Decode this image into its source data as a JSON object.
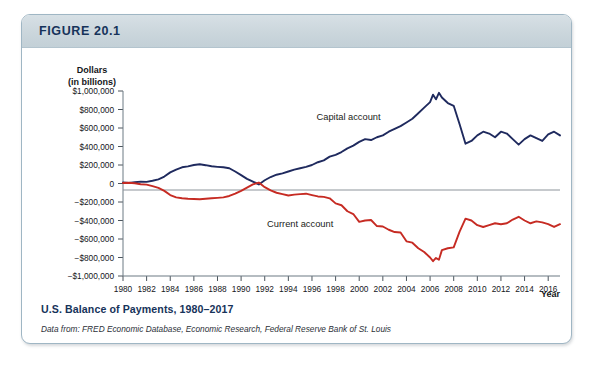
{
  "figure": {
    "number_label": "FIGURE 20.1",
    "caption_title": "U.S. Balance of Payments, 1980–2017",
    "caption_source": "Data from: FRED Economic Database, Economic Research, Federal Reserve Bank of St. Louis",
    "header_color": "#cbd6dc",
    "border_color": "#9fb6c4",
    "title_color": "#16335a"
  },
  "chart_data": {
    "type": "line",
    "title": "U.S. Balance of Payments, 1980–2017",
    "xlabel": "Year",
    "ylabel": "Dollars (in billions)",
    "ylabel_line1": "Dollars",
    "ylabel_line2": "(in billions)",
    "grid": false,
    "legend": "inline-annotations",
    "xlim": [
      1980,
      2017
    ],
    "ylim": [
      -1000000,
      1000000
    ],
    "ytick_labels": [
      "$1,000,000",
      "$800,000",
      "$600,000",
      "$400,000",
      "$200,000",
      "0",
      "−$200,000",
      "−$400,000",
      "−$600,000",
      "−$800,000",
      "−$1,000,000"
    ],
    "ytick_values": [
      1000000,
      800000,
      600000,
      400000,
      200000,
      0,
      -200000,
      -400000,
      -600000,
      -800000,
      -1000000
    ],
    "xtick_labels": [
      "1980",
      "1982",
      "1984",
      "1986",
      "1988",
      "1990",
      "1992",
      "1994",
      "1996",
      "1998",
      "2000",
      "2002",
      "2004",
      "2006",
      "2008",
      "2010",
      "2012",
      "2014",
      "2016"
    ],
    "xtick_values": [
      1980,
      1982,
      1984,
      1986,
      1988,
      1990,
      1992,
      1994,
      1996,
      1998,
      2000,
      2002,
      2004,
      2006,
      2008,
      2010,
      2012,
      2014,
      2016
    ],
    "series": [
      {
        "name": "Capital account",
        "label": "Capital account",
        "color": "#1f2a5e",
        "label_x": 1999.1,
        "label_y": 690000,
        "x": [
          1980,
          1980.5,
          1981,
          1981.5,
          1982,
          1982.5,
          1983,
          1983.5,
          1984,
          1984.5,
          1985,
          1985.5,
          1986,
          1986.5,
          1987,
          1987.5,
          1988,
          1988.5,
          1989,
          1989.5,
          1990,
          1990.5,
          1991,
          1991.5,
          1992,
          1992.5,
          1993,
          1993.5,
          1994,
          1994.5,
          1995,
          1995.5,
          1996,
          1996.5,
          1997,
          1997.5,
          1998,
          1998.5,
          1999,
          1999.5,
          2000,
          2000.5,
          2001,
          2001.5,
          2002,
          2002.5,
          2003,
          2003.5,
          2004,
          2004.5,
          2005,
          2005.5,
          2006,
          2006.25,
          2006.5,
          2006.75,
          2007,
          2007.5,
          2008,
          2008.5,
          2009,
          2009.5,
          2010,
          2010.5,
          2011,
          2011.5,
          2012,
          2012.5,
          2013,
          2013.5,
          2014,
          2014.5,
          2015,
          2015.5,
          2016,
          2016.5,
          2017
        ],
        "y": [
          10000,
          5000,
          14000,
          20000,
          18000,
          30000,
          45000,
          75000,
          120000,
          150000,
          175000,
          185000,
          200000,
          208000,
          198000,
          186000,
          180000,
          175000,
          165000,
          130000,
          90000,
          50000,
          20000,
          -10000,
          35000,
          70000,
          95000,
          110000,
          130000,
          150000,
          165000,
          180000,
          200000,
          230000,
          250000,
          290000,
          310000,
          340000,
          380000,
          410000,
          450000,
          480000,
          470000,
          500000,
          520000,
          560000,
          590000,
          620000,
          660000,
          700000,
          760000,
          820000,
          880000,
          960000,
          910000,
          980000,
          930000,
          870000,
          840000,
          640000,
          430000,
          460000,
          520000,
          560000,
          540000,
          500000,
          560000,
          540000,
          480000,
          420000,
          480000,
          520000,
          490000,
          460000,
          530000,
          560000,
          520000
        ]
      },
      {
        "name": "Current account",
        "label": "Current account",
        "color": "#c62b23",
        "label_x": 1995.0,
        "label_y": -470000,
        "x": [
          1980,
          1980.5,
          1981,
          1981.5,
          1982,
          1982.5,
          1983,
          1983.5,
          1984,
          1984.5,
          1985,
          1985.5,
          1986,
          1986.5,
          1987,
          1987.5,
          1988,
          1988.5,
          1989,
          1989.5,
          1990,
          1990.5,
          1991,
          1991.5,
          1992,
          1992.5,
          1993,
          1993.5,
          1994,
          1994.5,
          1995,
          1995.5,
          1996,
          1996.5,
          1997,
          1997.5,
          1998,
          1998.5,
          1999,
          1999.5,
          2000,
          2000.5,
          2001,
          2001.5,
          2002,
          2002.5,
          2003,
          2003.5,
          2004,
          2004.5,
          2005,
          2005.5,
          2006,
          2006.25,
          2006.5,
          2006.75,
          2007,
          2007.5,
          2008,
          2008.5,
          2009,
          2009.5,
          2010,
          2010.5,
          2011,
          2011.5,
          2012,
          2012.5,
          2013,
          2013.5,
          2014,
          2014.5,
          2015,
          2015.5,
          2016,
          2016.5,
          2017
        ],
        "y": [
          5000,
          8000,
          2000,
          -8000,
          -12000,
          -28000,
          -48000,
          -80000,
          -125000,
          -150000,
          -160000,
          -165000,
          -168000,
          -170000,
          -165000,
          -160000,
          -155000,
          -150000,
          -135000,
          -110000,
          -80000,
          -45000,
          -10000,
          10000,
          -40000,
          -75000,
          -100000,
          -115000,
          -130000,
          -120000,
          -115000,
          -110000,
          -125000,
          -140000,
          -145000,
          -160000,
          -215000,
          -235000,
          -300000,
          -330000,
          -415000,
          -400000,
          -395000,
          -460000,
          -465000,
          -500000,
          -525000,
          -530000,
          -625000,
          -640000,
          -700000,
          -740000,
          -800000,
          -840000,
          -805000,
          -825000,
          -720000,
          -700000,
          -690000,
          -520000,
          -380000,
          -400000,
          -450000,
          -470000,
          -450000,
          -430000,
          -440000,
          -430000,
          -390000,
          -360000,
          -400000,
          -430000,
          -410000,
          -420000,
          -440000,
          -470000,
          -440000
        ]
      }
    ]
  }
}
